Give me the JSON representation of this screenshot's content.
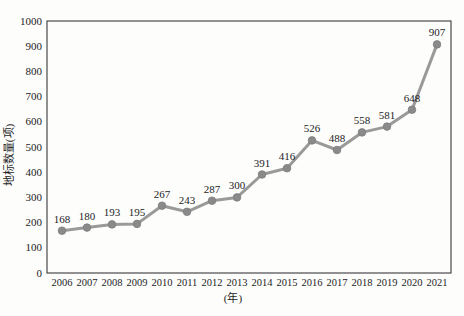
{
  "chart_data": {
    "type": "line",
    "title": "",
    "categories": [
      "2006",
      "2007",
      "2008",
      "2009",
      "2010",
      "2011",
      "2012",
      "2013",
      "2014",
      "2015",
      "2016",
      "2017",
      "2018",
      "2019",
      "2020",
      "2021"
    ],
    "values": [
      168,
      180,
      193,
      195,
      267,
      243,
      287,
      300,
      391,
      416,
      526,
      488,
      558,
      581,
      648,
      907
    ],
    "xlabel": "(年)",
    "ylabel": "地标数量(项)",
    "ylim": [
      0,
      1000
    ],
    "ytick_step": 100,
    "grid": false,
    "legend": "none",
    "data_labels": true,
    "colors": {
      "line": "#9a9a9a",
      "marker": "#8a8a8a",
      "marker_edge": "#7d7d7d",
      "axis": "#4a4a4a",
      "text": "#1c1c1c"
    }
  }
}
